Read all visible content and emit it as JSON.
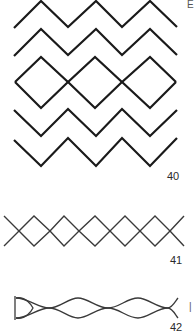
{
  "figures": [
    {
      "id": "zigzag-diamond",
      "label": "40"
    },
    {
      "id": "cross-lattice",
      "label": "41"
    },
    {
      "id": "chain-loops",
      "label": "42"
    }
  ],
  "edge_marks": {
    "top_right": "E",
    "bottom_right": "|"
  },
  "colors": {
    "stroke_dark": "#1a1a1a",
    "stroke_mid": "#3a3a3a",
    "background": "#ffffff"
  }
}
